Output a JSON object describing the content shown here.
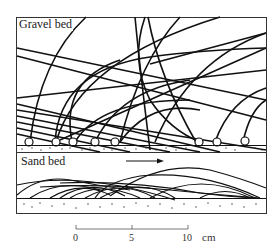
{
  "figure": {
    "panels": [
      {
        "id": "gravel",
        "label": "Gravel bed"
      },
      {
        "id": "sand",
        "label": "Sand bed"
      }
    ],
    "flow_arrow": {
      "direction": "right"
    },
    "scale_bar": {
      "ticks": [
        "0",
        "5",
        "10"
      ],
      "unit": "cm"
    }
  }
}
